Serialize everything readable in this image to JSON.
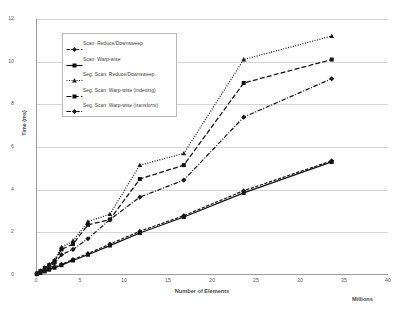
{
  "chart_data": {
    "type": "line",
    "title": "",
    "xlabel": "Number of Elements",
    "xunit": "Millions",
    "ylabel": "Time (ms)",
    "xlim": [
      0,
      40
    ],
    "ylim": [
      0,
      12
    ],
    "xticks": [
      "0",
      "5",
      "10",
      "15",
      "20",
      "25",
      "30",
      "35",
      "40"
    ],
    "yticks": [
      "0",
      "2",
      "4",
      "6",
      "8",
      "10",
      "12"
    ],
    "grid": "horizontal",
    "legend_position": "upper-left-inside",
    "series": [
      {
        "name": "Scan: Reduce/Downsweep",
        "marker": "diamond",
        "dash": "dashed",
        "color": "#1a1a1a",
        "points": [
          [
            0.1,
            0.05
          ],
          [
            0.5,
            0.12
          ],
          [
            1.0,
            0.2
          ],
          [
            1.5,
            0.28
          ],
          [
            2.1,
            0.38
          ],
          [
            2.9,
            0.5
          ],
          [
            4.2,
            0.72
          ],
          [
            5.9,
            1.0
          ],
          [
            8.4,
            1.45
          ],
          [
            11.8,
            2.05
          ],
          [
            16.8,
            2.78
          ],
          [
            23.6,
            3.95
          ],
          [
            33.6,
            5.35
          ]
        ]
      },
      {
        "name": "Scan: Warp-wise",
        "marker": "square",
        "dash": "solid",
        "color": "#111111",
        "points": [
          [
            0.1,
            0.04
          ],
          [
            0.5,
            0.1
          ],
          [
            1.0,
            0.17
          ],
          [
            1.5,
            0.25
          ],
          [
            2.1,
            0.34
          ],
          [
            2.9,
            0.46
          ],
          [
            4.2,
            0.68
          ],
          [
            5.9,
            0.95
          ],
          [
            8.4,
            1.38
          ],
          [
            11.8,
            1.97
          ],
          [
            16.8,
            2.72
          ],
          [
            23.6,
            3.85
          ],
          [
            33.6,
            5.3
          ]
        ]
      },
      {
        "name": "Seg. Scan: Reduce/Downsweep",
        "marker": "triangle",
        "dash": "dotted",
        "color": "#1a1a1a",
        "points": [
          [
            0.1,
            0.08
          ],
          [
            0.5,
            0.2
          ],
          [
            1.0,
            0.35
          ],
          [
            1.5,
            0.5
          ],
          [
            2.1,
            0.7
          ],
          [
            2.9,
            1.3
          ],
          [
            4.2,
            1.6
          ],
          [
            5.9,
            2.5
          ],
          [
            8.4,
            2.85
          ],
          [
            11.8,
            5.15
          ],
          [
            16.8,
            5.7
          ],
          [
            23.6,
            10.1
          ],
          [
            33.6,
            11.2
          ]
        ]
      },
      {
        "name": "Seg. Scan: Warp-wise (indexing)",
        "marker": "square",
        "dash": "long-dash",
        "color": "#111111",
        "points": [
          [
            0.1,
            0.07
          ],
          [
            0.5,
            0.18
          ],
          [
            1.0,
            0.32
          ],
          [
            1.5,
            0.46
          ],
          [
            2.1,
            0.64
          ],
          [
            2.9,
            1.2
          ],
          [
            4.2,
            1.45
          ],
          [
            5.9,
            2.35
          ],
          [
            8.4,
            2.6
          ],
          [
            11.8,
            4.5
          ],
          [
            16.8,
            5.15
          ],
          [
            23.6,
            9.0
          ],
          [
            33.6,
            10.1
          ]
        ]
      },
      {
        "name": "Seg. Scan: Warp-wise (transform)",
        "marker": "plus-diamond",
        "dash": "dash-dot",
        "color": "#1a1a1a",
        "points": [
          [
            0.1,
            0.06
          ],
          [
            0.5,
            0.15
          ],
          [
            1.0,
            0.27
          ],
          [
            1.5,
            0.4
          ],
          [
            2.1,
            0.55
          ],
          [
            2.9,
            0.95
          ],
          [
            4.2,
            1.2
          ],
          [
            5.9,
            1.7
          ],
          [
            8.4,
            2.6
          ],
          [
            11.8,
            3.65
          ],
          [
            16.8,
            4.45
          ],
          [
            23.6,
            7.4
          ],
          [
            33.6,
            9.2
          ]
        ]
      }
    ]
  }
}
